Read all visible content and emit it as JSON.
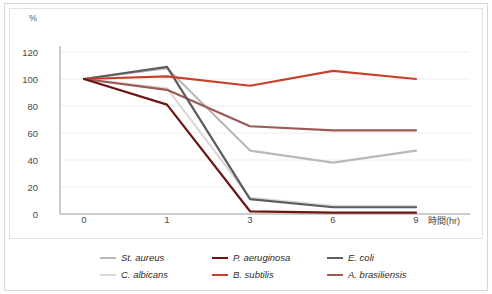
{
  "axis": {
    "unit_label": "%",
    "x_title": "時間(hr)",
    "y_ticks": [
      "0",
      "20",
      "40",
      "60",
      "80",
      "100",
      "120"
    ],
    "x_ticks": [
      "0",
      "1",
      "3",
      "6",
      "9"
    ]
  },
  "legend": {
    "entries": [
      {
        "label": "St. aureus",
        "color": "#b9b9b9"
      },
      {
        "label": "P. aeruginosa",
        "color": "#6e1511"
      },
      {
        "label": "E. coli",
        "color": "#5d5d5d"
      },
      {
        "label": "C. albicans",
        "color": "#e0d7d5"
      },
      {
        "label": "B. subtilis",
        "color": "#c8402b"
      },
      {
        "label": "A. brasiliensis",
        "color": "#9b5a56"
      }
    ]
  },
  "chart_data": {
    "type": "line",
    "title": "",
    "xlabel": "時間(hr)",
    "ylabel": "%",
    "categories": [
      "0",
      "1",
      "3",
      "6",
      "9"
    ],
    "x_numeric": [
      0,
      1,
      3,
      6,
      9
    ],
    "ylim": [
      0,
      120
    ],
    "y_ticks": [
      0,
      20,
      40,
      60,
      80,
      100,
      120
    ],
    "grid": true,
    "legend_position": "bottom",
    "series": [
      {
        "name": "St. aureus",
        "color": "#b9b9b9",
        "values": [
          100,
          108,
          47,
          38,
          47
        ]
      },
      {
        "name": "P. aeruginosa",
        "color": "#6e1511",
        "values": [
          100,
          81,
          2,
          1,
          1
        ]
      },
      {
        "name": "E. coli",
        "color": "#5d5d5d",
        "values": [
          100,
          109,
          11,
          5,
          5
        ]
      },
      {
        "name": "C. albicans",
        "color": "#e0d7d5",
        "values": [
          100,
          93,
          12,
          6,
          6
        ]
      },
      {
        "name": "B. subtilis",
        "color": "#c8402b",
        "values": [
          100,
          102,
          95,
          106,
          100
        ]
      },
      {
        "name": "A. brasiliensis",
        "color": "#9b5a56",
        "values": [
          100,
          92,
          65,
          62,
          62
        ]
      }
    ]
  }
}
